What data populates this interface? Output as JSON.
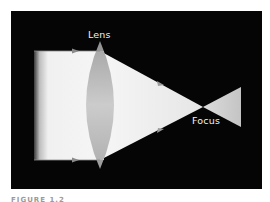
{
  "figure": {
    "labels": {
      "lens": "Lens",
      "focus": "Focus"
    },
    "caption": "FIGURE 1.2",
    "colors": {
      "background": "#050505",
      "beam": "#f4f4f4",
      "lens": "#b8b8b8",
      "arrow": "#9a9a9a"
    },
    "elements": {
      "incoming_beam": "parallel light rays",
      "lens": "convex lens",
      "converging_beam": "rays converging to focus",
      "diverging_beam": "rays diverging after focus"
    }
  }
}
